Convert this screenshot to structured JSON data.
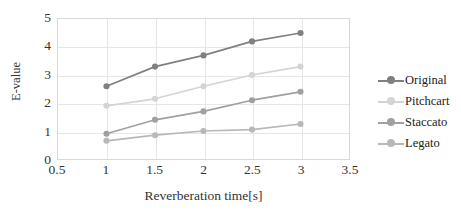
{
  "chart_data": {
    "type": "line",
    "title": "",
    "xlabel": "Reverberation time[s]",
    "ylabel": "E-value",
    "x": [
      1,
      1.5,
      2,
      2.5,
      3
    ],
    "xlim": [
      0.5,
      3.5
    ],
    "ylim": [
      0,
      5
    ],
    "xticks": [
      "0.5",
      "1",
      "1.5",
      "2",
      "2.5",
      "3",
      "3.5"
    ],
    "xtick_values": [
      0.5,
      1,
      1.5,
      2,
      2.5,
      3,
      3.5
    ],
    "yticks": [
      "0",
      "1",
      "2",
      "3",
      "4",
      "5"
    ],
    "ytick_values": [
      0,
      1,
      2,
      3,
      4,
      5
    ],
    "grid": true,
    "legend_position": "right",
    "series": [
      {
        "name": "Original",
        "color": "#808080",
        "values": [
          2.6,
          3.3,
          3.7,
          4.2,
          4.5
        ]
      },
      {
        "name": "Pitchcart",
        "color": "#d4d4d4",
        "values": [
          1.9,
          2.15,
          2.6,
          3.0,
          3.3
        ]
      },
      {
        "name": "Staccato",
        "color": "#a0a0a0",
        "values": [
          0.9,
          1.4,
          1.7,
          2.1,
          2.4
        ]
      },
      {
        "name": "Legato",
        "color": "#b8b8b8",
        "values": [
          0.65,
          0.85,
          1.0,
          1.05,
          1.25
        ]
      }
    ]
  },
  "legend": {
    "items": [
      {
        "label": "Original"
      },
      {
        "label": "Pitchcart"
      },
      {
        "label": "Staccato"
      },
      {
        "label": "Legato"
      }
    ]
  }
}
